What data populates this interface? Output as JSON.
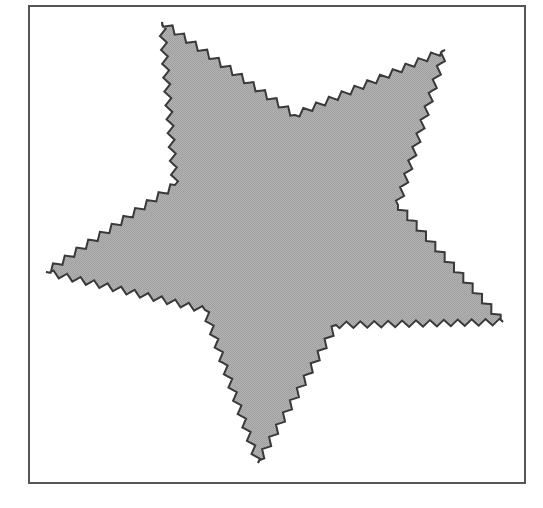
{
  "figure": {
    "frame": {
      "x": 28,
      "y": 5,
      "width": 494,
      "height": 475,
      "border_color": "#555555"
    },
    "shape": {
      "type": "five-pointed-star",
      "edge_style": "zigzag",
      "fill_color": "#b4b4b4",
      "fill_dither_color": "#9e9e9e",
      "stroke_color": "#3a3a3a",
      "stroke_width": 2,
      "zigzag_amplitude": 3.2,
      "zigzag_wavelength": 7,
      "vertices": [
        [
          162,
          22
        ],
        [
          295,
          115
        ],
        [
          445,
          50
        ],
        [
          398,
          205
        ],
        [
          503,
          322
        ],
        [
          336,
          325
        ],
        [
          258,
          463
        ],
        [
          205,
          310
        ],
        [
          46,
          272
        ],
        [
          175,
          185
        ]
      ]
    }
  }
}
